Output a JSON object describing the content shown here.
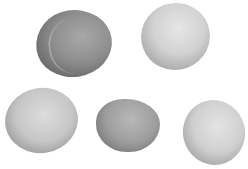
{
  "image": {
    "description": "Grayscale photograph of five rounded stones on a white background",
    "background_color": "#ffffff",
    "stones": [
      {
        "id": 1,
        "position": "top-left",
        "tone": "medium-dark gray",
        "color": "#8e8e8e"
      },
      {
        "id": 2,
        "position": "top-right",
        "tone": "light gray",
        "color": "#d2d2d2"
      },
      {
        "id": 3,
        "position": "bottom-left",
        "tone": "light gray",
        "color": "#c6c6c6"
      },
      {
        "id": 4,
        "position": "bottom-center",
        "tone": "medium gray",
        "color": "#9e9e9e"
      },
      {
        "id": 5,
        "position": "bottom-right",
        "tone": "light gray, pitted",
        "color": "#d0d0d0"
      }
    ]
  }
}
